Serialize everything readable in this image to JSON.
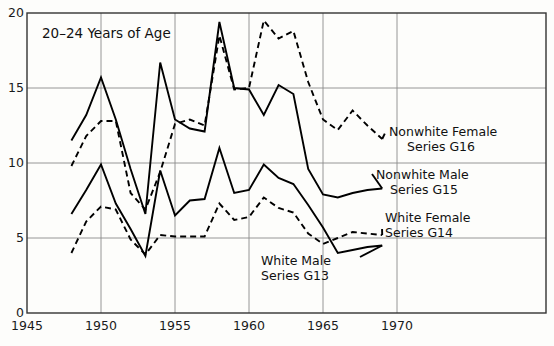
{
  "panel": {
    "title": "20–24 Years of Age"
  },
  "chart_data": {
    "type": "line",
    "title": "20–24 Years of Age",
    "xlabel": "",
    "ylabel": "",
    "xlim": [
      1945,
      1972
    ],
    "ylim": [
      0,
      20
    ],
    "grid": true,
    "legend_position": "right-inline-annotations",
    "x_ticks": [
      1945,
      1950,
      1955,
      1960,
      1965,
      1970
    ],
    "x_tick_labels": [
      "1945",
      "1950",
      "1955",
      "1960",
      "1965",
      "1970"
    ],
    "y_ticks": [
      0,
      5,
      10,
      15,
      20
    ],
    "y_tick_labels": [
      "0",
      "5",
      "10",
      "15",
      "20"
    ],
    "series": [
      {
        "name": "Nonwhite Male",
        "code": "Series G15",
        "label_line1": "Nonwhite Male",
        "label_line2": "Series G15",
        "style": "solid",
        "x": [
          1948,
          1949,
          1950,
          1951,
          1952,
          1953,
          1954,
          1955,
          1956,
          1957,
          1958,
          1959,
          1960,
          1961,
          1962,
          1963,
          1964,
          1965,
          1966,
          1967,
          1968,
          1969
        ],
        "values": [
          11.5,
          13.2,
          15.7,
          12.9,
          9.6,
          6.6,
          16.7,
          12.9,
          12.3,
          12.1,
          19.4,
          15.0,
          14.9,
          13.2,
          15.2,
          14.6,
          9.6,
          7.9,
          7.7,
          8.0,
          8.2,
          8.3
        ]
      },
      {
        "name": "Nonwhite Female",
        "code": "Series G16",
        "label_line1": "Nonwhite Female",
        "label_line2": "Series G16",
        "style": "dashed",
        "x": [
          1948,
          1949,
          1950,
          1951,
          1952,
          1953,
          1954,
          1955,
          1956,
          1957,
          1958,
          1959,
          1960,
          1961,
          1962,
          1963,
          1964,
          1965,
          1966,
          1967,
          1968,
          1969
        ],
        "values": [
          9.8,
          11.8,
          12.8,
          12.8,
          8.0,
          6.9,
          9.4,
          12.6,
          12.9,
          12.5,
          18.5,
          14.9,
          15.0,
          19.5,
          18.3,
          18.8,
          15.4,
          12.9,
          12.2,
          13.5,
          12.5,
          11.6
        ]
      },
      {
        "name": "White Male",
        "code": "Series G13",
        "label_line1": "White Male",
        "label_line2": "Series G13",
        "style": "solid",
        "x": [
          1948,
          1949,
          1950,
          1951,
          1952,
          1953,
          1954,
          1955,
          1956,
          1957,
          1958,
          1959,
          1960,
          1961,
          1962,
          1963,
          1964,
          1965,
          1966,
          1967,
          1968,
          1969
        ],
        "values": [
          6.6,
          8.2,
          9.9,
          7.3,
          5.6,
          3.8,
          9.5,
          6.5,
          7.5,
          7.6,
          11.0,
          8.0,
          8.2,
          9.9,
          9.0,
          8.6,
          7.2,
          5.7,
          4.0,
          4.2,
          4.4,
          4.5
        ]
      },
      {
        "name": "White Female",
        "code": "Series G14",
        "label_line1": "White Female",
        "label_line2": "Series G14",
        "style": "dashed",
        "x": [
          1948,
          1949,
          1950,
          1951,
          1952,
          1953,
          1954,
          1955,
          1956,
          1957,
          1958,
          1959,
          1960,
          1961,
          1962,
          1963,
          1964,
          1965,
          1966,
          1967,
          1968,
          1969
        ],
        "values": [
          4.0,
          6.1,
          7.1,
          6.9,
          4.9,
          3.9,
          5.2,
          5.1,
          5.1,
          5.1,
          7.3,
          6.2,
          6.4,
          7.7,
          7.0,
          6.7,
          5.3,
          4.6,
          5.0,
          5.4,
          5.3,
          5.2
        ]
      }
    ]
  },
  "annotations": [
    {
      "id": "ann-g16",
      "line1": "Nonwhite Female",
      "line2": "Series G16"
    },
    {
      "id": "ann-g15",
      "line1": "Nonwhite Male",
      "line2": "Series G15"
    },
    {
      "id": "ann-g14",
      "line1": "White Female",
      "line2": "Series G14"
    },
    {
      "id": "ann-g13",
      "line1": "White Male",
      "line2": "Series G13"
    }
  ],
  "colors": {
    "line": "#000000",
    "grid": "#8a8a8a",
    "axis": "#333333",
    "background": "#fdfdfb"
  }
}
